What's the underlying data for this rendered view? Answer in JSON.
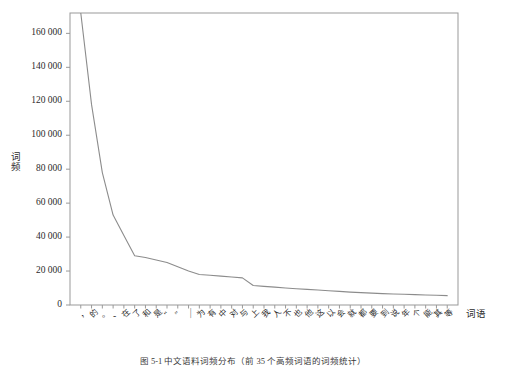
{
  "figure": {
    "caption": "图 5-1  中文语料词频分布（前 35 个高频词语的词频统计）",
    "line_color": "#8c8c8c",
    "frame_color": "#999999",
    "text_color": "#2b2b2b",
    "background": "#ffffff"
  },
  "chart_data": {
    "type": "line",
    "title": "",
    "xlabel": "词语",
    "ylabel": "词频",
    "ylim": [
      0,
      172000
    ],
    "xlim": [
      0,
      36
    ],
    "grid": false,
    "legend": null,
    "yticks": [
      0,
      20000,
      40000,
      60000,
      80000,
      100000,
      120000,
      140000,
      160000
    ],
    "ytick_labels": [
      "0",
      "20 000",
      "40 000",
      "60 000",
      "80 000",
      "100 000",
      "120 000",
      "140 000",
      "160 000"
    ],
    "categories": [
      "，",
      "的",
      "。",
      "、",
      "在",
      "了",
      "和",
      "是",
      "“",
      "”",
      "／",
      "为",
      "有",
      "中",
      "对",
      "与",
      "上",
      "我",
      "人",
      "不",
      "也",
      "他",
      "这",
      "以",
      "会",
      "就",
      "都",
      "要",
      "到",
      "说",
      "年",
      "个",
      "能",
      "其",
      "等"
    ],
    "values": [
      172000,
      118000,
      78000,
      53000,
      41000,
      29000,
      28000,
      26500,
      25000,
      22500,
      20000,
      18000,
      17500,
      17000,
      16500,
      16000,
      11500,
      11000,
      10500,
      10000,
      9600,
      9200,
      8800,
      8400,
      8000,
      7600,
      7300,
      7000,
      6700,
      6500,
      6300,
      6100,
      5900,
      5700,
      5500
    ],
    "annotations": [
      "首个数据点超出纵轴显示范围",
      "曲线呈齐普夫分布（长尾）"
    ]
  }
}
